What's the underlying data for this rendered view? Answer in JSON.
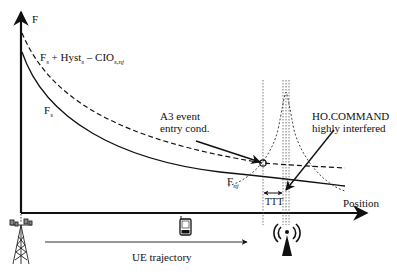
{
  "diagram": {
    "y_axis_label": "F",
    "x_axis_label": "Position",
    "curves": {
      "serving_offset": {
        "main": "F",
        "sub1": "s",
        "plus": " + Hyst",
        "sub2": "s",
        "minus": " – CIO",
        "sub3": "s,nj",
        "style": "dashed"
      },
      "serving": {
        "main": "F",
        "sub": "s",
        "style": "solid"
      },
      "neighbor": {
        "main": "F",
        "sub": "nj",
        "style": "dotted"
      }
    },
    "annotations": {
      "a3_line1": "A3 event",
      "a3_line2": "entry cond.",
      "ho_line1": "HO.COMMAND",
      "ho_line2": "highly interfered",
      "ttt": "TTT"
    },
    "trajectory_label": "UE trajectory",
    "icons": [
      "serving-cell-tower-icon",
      "mobile-phone-icon",
      "neighbor-antenna-icon"
    ]
  }
}
